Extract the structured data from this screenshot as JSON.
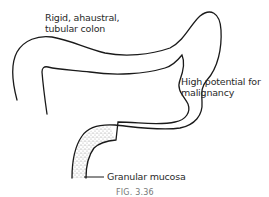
{
  "diagram": {
    "labels": {
      "rigid": [
        "Rigid, ahaustral,",
        "tubular colon"
      ],
      "malignancy": [
        "High potential for",
        "malignancy"
      ],
      "mucosa": "Granular mucosa"
    },
    "caption": "FIG. 3.36",
    "colors": {
      "line": "#1a1a1a",
      "stipple": "#bdbdbd",
      "text": "#2a2a2a",
      "caption": "#777777"
    }
  }
}
